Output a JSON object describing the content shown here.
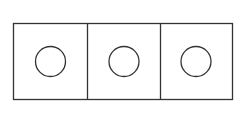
{
  "diagram": {
    "stroke_color": "#333333",
    "background": "#ffffff",
    "frame": {
      "x": 13.5,
      "y": 23.5,
      "width": 219,
      "height": 76
    },
    "cells": [
      {
        "x": 13.5,
        "width": 74,
        "circle": {
          "cx": 50.5,
          "cy": 61.5,
          "r": 15
        }
      },
      {
        "x": 87.5,
        "width": 73,
        "circle": {
          "cx": 124,
          "cy": 61.5,
          "r": 15
        }
      },
      {
        "x": 160.5,
        "width": 72,
        "circle": {
          "cx": 196,
          "cy": 61.5,
          "r": 15
        }
      }
    ]
  }
}
